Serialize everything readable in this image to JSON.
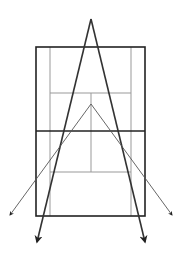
{
  "diagram": {
    "colors": {
      "court_outline": "#222222",
      "court_inner_lines": "#999999",
      "wide_shots": "#333333",
      "short_angle_shots": "#555555",
      "background": "#ffffff"
    },
    "court": {
      "outer": {
        "x": 36,
        "y": 47,
        "w": 109,
        "h": 169
      },
      "singles_left_x": 50,
      "singles_right_x": 131,
      "net_y": 131,
      "service_top_y": 93,
      "service_bottom_y": 172,
      "center_x": 91
    },
    "shots": [
      {
        "name": "deep-left",
        "from": [
          91,
          19
        ],
        "to": [
          37,
          242
        ],
        "weight": 1.6
      },
      {
        "name": "deep-right",
        "from": [
          91,
          19
        ],
        "to": [
          145,
          242
        ],
        "weight": 1.6
      },
      {
        "name": "angle-left",
        "from": [
          91,
          104
        ],
        "to": [
          10,
          215
        ],
        "weight": 0.9
      },
      {
        "name": "angle-right",
        "from": [
          91,
          104
        ],
        "to": [
          172,
          215
        ],
        "weight": 0.9
      }
    ]
  }
}
